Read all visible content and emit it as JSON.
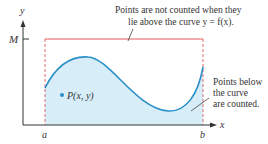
{
  "diagram": {
    "axes": {
      "x_label": "x",
      "y_label": "y",
      "y_tick_label": "M",
      "x_tick_labels": [
        "a",
        "b"
      ]
    },
    "point": {
      "label": "P(x, y)"
    },
    "annotations": {
      "top": {
        "line1": "Points are not counted when they",
        "line2": "lie above the curve y = f(x)."
      },
      "right": {
        "line1": "Points below",
        "line2": "the curve",
        "line3": "are counted."
      }
    },
    "colors": {
      "curve": "#2a8fc9",
      "fill": "#d7eef9",
      "rectangle": "#e05a5a",
      "axis": "#333333",
      "text": "#333333",
      "point": "#2a8fc9"
    }
  }
}
